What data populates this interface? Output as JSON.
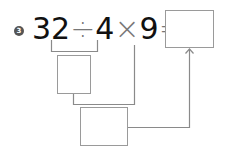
{
  "problem": {
    "number_badge": "3",
    "expression": {
      "tokens": [
        "32",
        "÷",
        "4",
        "×",
        "9",
        "="
      ]
    },
    "answer_box_value": "",
    "intermediate_box_value": "",
    "second_step_box_value": ""
  },
  "colors": {
    "line": "#8a8a8a",
    "text": "#111111",
    "operator": "#777777",
    "badge": "#555555"
  }
}
